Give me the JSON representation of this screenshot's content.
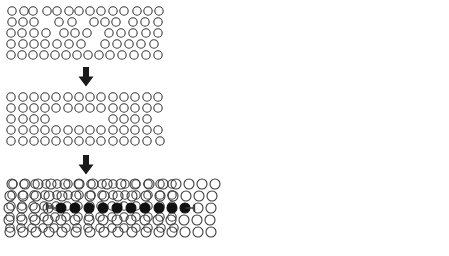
{
  "figure": {
    "background_color": "#ffffff",
    "stroke_color": "#3a3a3a",
    "fill_color": "#111111",
    "arrow_color": "#1a1a1a"
  },
  "panels": [
    {
      "id": "panel-1",
      "name": "panel-raw-detection",
      "label": "Raw detected circles",
      "x": 8,
      "y": 6,
      "width": 168,
      "height": 58,
      "circle_radius": 4.2,
      "stroke_width": 1.1,
      "rows": [
        {
          "y": 11,
          "cx": [
            12,
            24,
            33,
            47,
            57,
            69,
            79,
            90,
            101,
            113,
            124,
            137,
            148,
            159
          ],
          "filled": []
        },
        {
          "y": 22,
          "cx": [
            12,
            23,
            34,
            59,
            72,
            94,
            105,
            116,
            133,
            145,
            158
          ],
          "filled": []
        },
        {
          "y": 33,
          "cx": [
            11,
            22,
            34,
            46,
            64,
            75,
            87,
            109,
            121,
            133,
            146,
            158
          ],
          "filled": []
        },
        {
          "y": 44,
          "cx": [
            11,
            23,
            34,
            45,
            57,
            69,
            81,
            105,
            117,
            129,
            141,
            154
          ],
          "filled": []
        },
        {
          "y": 55,
          "cx": [
            11,
            22,
            33,
            44,
            55,
            66,
            77,
            88,
            99,
            110,
            122,
            134,
            146,
            158
          ],
          "filled": []
        }
      ]
    },
    {
      "id": "panel-2",
      "name": "panel-filtered-grid",
      "label": "Filtered / aligned grid",
      "x": 8,
      "y": 92,
      "width": 168,
      "height": 58,
      "circle_radius": 4.2,
      "stroke_width": 1.1,
      "rows": [
        {
          "y": 97,
          "cx": [
            11,
            23,
            34,
            45,
            56,
            68,
            79,
            90,
            101,
            113,
            124,
            135,
            147,
            158
          ],
          "filled": []
        },
        {
          "y": 108,
          "cx": [
            11,
            23,
            34,
            45,
            56,
            68,
            79,
            90,
            101,
            113,
            124,
            135,
            147,
            158
          ],
          "filled": []
        },
        {
          "y": 119,
          "cx": [
            11,
            23,
            34,
            45,
            113,
            124,
            135,
            147
          ],
          "filled": []
        },
        {
          "y": 130,
          "cx": [
            11,
            23,
            34,
            45,
            56,
            68,
            79,
            90,
            101,
            113,
            124,
            135,
            147,
            158
          ],
          "filled": []
        },
        {
          "y": 141,
          "cx": [
            11,
            23,
            34,
            45,
            56,
            68,
            79,
            90,
            101,
            113,
            124,
            135,
            147,
            160
          ],
          "filled": []
        }
      ]
    },
    {
      "id": "panel-3",
      "name": "panel-measured-grid",
      "label": "Measured grid with span markers",
      "x": 8,
      "y": 178,
      "width": 176,
      "height": 58,
      "circle_radius": 4.2,
      "stroke_width": 1.1,
      "rows": [
        {
          "y": 184,
          "cx": [
            13,
            24,
            35,
            46,
            57,
            68,
            79,
            91,
            102,
            113,
            125,
            136,
            148,
            160,
            172
          ],
          "filled": []
        },
        {
          "y": 195,
          "cx": [
            12,
            23,
            34,
            45,
            57,
            68,
            79,
            91,
            102,
            113,
            125,
            136,
            148,
            160,
            172
          ],
          "filled": []
        },
        {
          "y": 206,
          "cx": [
            11,
            22,
            33,
            44,
            56,
            67,
            78,
            90,
            101,
            112,
            124,
            136,
            148,
            160,
            172
          ],
          "filled": []
        },
        {
          "y": 217,
          "cx": [
            10,
            21,
            33,
            44,
            55,
            66,
            78,
            89,
            100,
            112,
            124,
            136,
            148,
            160,
            172
          ],
          "filled": []
        },
        {
          "y": 228,
          "cx": [
            10,
            21,
            32,
            43,
            54,
            66,
            77,
            88,
            100,
            112,
            124,
            136,
            148,
            161,
            174
          ],
          "filled": []
        }
      ],
      "span_markers": [
        {
          "name": "span-tick-left",
          "x": 50,
          "y": 206,
          "length": 7,
          "orientation": "horizontal"
        },
        {
          "name": "span-tick-right",
          "x": 118,
          "y": 206,
          "length": 7,
          "orientation": "horizontal"
        }
      ]
    },
    {
      "id": "panel-4",
      "name": "panel-result-highlighted",
      "label": "Result: highlighted circle row",
      "x": 220,
      "y": 176,
      "width": 224,
      "height": 58,
      "circle_radius": 5.0,
      "stroke_width": 1.1,
      "rows": [
        {
          "y": 184,
          "cx": [
            12,
            25,
            38,
            51,
            65,
            79,
            93,
            107,
            121,
            135,
            149,
            163,
            176,
            189,
            202,
            215
          ],
          "filled": []
        },
        {
          "y": 196,
          "cx": [
            10,
            23,
            36,
            49,
            62,
            76,
            90,
            104,
            118,
            132,
            146,
            160,
            173,
            186,
            199,
            212
          ],
          "filled": []
        },
        {
          "y": 208,
          "cx": [
            9,
            22,
            35,
            48,
            61,
            75,
            89,
            103,
            117,
            131,
            145,
            159,
            172,
            185,
            198,
            211
          ],
          "filled": [
            61,
            75,
            89,
            103,
            117,
            131,
            145,
            159,
            172,
            185
          ]
        },
        {
          "y": 220,
          "cx": [
            9,
            22,
            35,
            48,
            61,
            75,
            89,
            103,
            117,
            131,
            145,
            158,
            171,
            184,
            197,
            210
          ],
          "filled": []
        },
        {
          "y": 232,
          "cx": [
            10,
            23,
            36,
            49,
            62,
            76,
            90,
            104,
            118,
            132,
            146,
            159,
            172,
            185,
            198,
            211
          ]
        }
      ],
      "span_markers": [
        {
          "name": "span-tick-left",
          "x": 52,
          "y": 208,
          "length": 9,
          "orientation": "horizontal"
        },
        {
          "name": "span-tick-right",
          "x": 190,
          "y": 208,
          "length": 9,
          "orientation": "horizontal"
        }
      ],
      "highlighted_count": 10
    }
  ],
  "arrows": [
    {
      "id": "arrow-1",
      "name": "arrow-stage1-to-stage2",
      "label": "down-arrow",
      "x": 76,
      "y": 66,
      "width": 20,
      "height": 22,
      "direction": "down"
    },
    {
      "id": "arrow-2",
      "name": "arrow-stage2-to-stage3",
      "label": "down-arrow",
      "x": 76,
      "y": 154,
      "width": 20,
      "height": 22,
      "direction": "down"
    }
  ],
  "chart_data": {
    "type": "scatter",
    "xlabel": "",
    "ylabel": "",
    "series": [
      {
        "name": "stage-1-raw",
        "circles_total": 63,
        "circles_filled": 0,
        "rows": 5,
        "description": "Irregular scattered circle detections with gaps"
      },
      {
        "name": "stage-2-filtered",
        "circles_total": 64,
        "circles_filled": 0,
        "rows": 5,
        "description": "Regularized grid with a missing middle segment in row 3"
      },
      {
        "name": "stage-3-measured",
        "circles_total": 75,
        "circles_filled": 0,
        "rows": 5,
        "description": "Dense grid with two horizontal span tick markers on row 3"
      },
      {
        "name": "stage-4-result",
        "circles_total": 80,
        "circles_filled": 10,
        "rows": 5,
        "description": "Final result, 10 filled circles on row 3 bracketed by tick markers"
      }
    ],
    "grid": false,
    "legend": "none"
  }
}
